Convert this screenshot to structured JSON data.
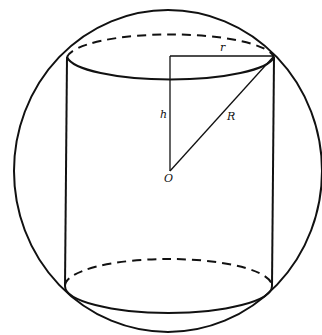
{
  "figure": {
    "labels": {
      "radius_cylinder": "r",
      "half_height": "h",
      "radius_sphere": "R",
      "center": "O"
    },
    "colors": {
      "line": "#111111",
      "background": "#ffffff"
    }
  }
}
